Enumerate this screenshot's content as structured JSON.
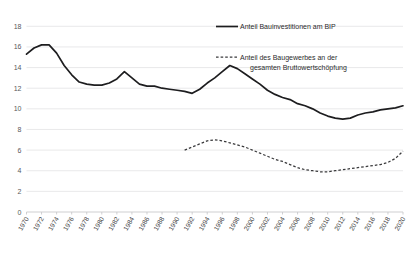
{
  "chart_data": {
    "type": "line",
    "title": "",
    "subtitle": "",
    "xlabel": "",
    "ylabel": "",
    "ylim": [
      0,
      19
    ],
    "xlim": [
      1970,
      2020
    ],
    "grid": true,
    "legend_position": "top-right",
    "y_ticks": [
      "0",
      "2",
      "4",
      "6",
      "8",
      "10",
      "12",
      "14",
      "16",
      "18"
    ],
    "y_tick_values": [
      0,
      2,
      4,
      6,
      8,
      10,
      12,
      14,
      16,
      18
    ],
    "x_ticks": [
      "1970",
      "1972",
      "1974",
      "1976",
      "1978",
      "1980",
      "1982",
      "1984",
      "1986",
      "1988",
      "1990",
      "1992",
      "1994",
      "1996",
      "1998",
      "2000",
      "2002",
      "2004",
      "2006",
      "2008",
      "2010",
      "2012",
      "2014",
      "2016",
      "2018",
      "2020"
    ],
    "x_tick_values": [
      1970,
      1972,
      1974,
      1976,
      1978,
      1980,
      1982,
      1984,
      1986,
      1988,
      1990,
      1992,
      1994,
      1996,
      1998,
      2000,
      2002,
      2004,
      2006,
      2008,
      2010,
      2012,
      2014,
      2016,
      2018,
      2020
    ],
    "series": [
      {
        "name": "Anteil Bauinvestitionen am BIP",
        "style": "solid",
        "color": "#1d1d1f",
        "x": [
          1970,
          1971,
          1972,
          1973,
          1974,
          1975,
          1976,
          1977,
          1978,
          1979,
          1980,
          1981,
          1982,
          1983,
          1984,
          1985,
          1986,
          1987,
          1988,
          1989,
          1990,
          1991,
          1992,
          1993,
          1994,
          1995,
          1996,
          1997,
          1998,
          1999,
          2000,
          2001,
          2002,
          2003,
          2004,
          2005,
          2006,
          2007,
          2008,
          2009,
          2010,
          2011,
          2012,
          2013,
          2014,
          2015,
          2016,
          2017,
          2018,
          2019,
          2020
        ],
        "values": [
          15.3,
          15.9,
          16.2,
          16.2,
          15.4,
          14.2,
          13.3,
          12.6,
          12.4,
          12.3,
          12.3,
          12.5,
          12.9,
          13.6,
          13.0,
          12.4,
          12.2,
          12.2,
          12.0,
          11.9,
          11.8,
          11.7,
          11.5,
          11.9,
          12.5,
          13.0,
          13.6,
          14.2,
          13.9,
          13.4,
          12.9,
          12.4,
          11.8,
          11.4,
          11.1,
          10.9,
          10.5,
          10.3,
          10.0,
          9.6,
          9.3,
          9.1,
          9.0,
          9.1,
          9.4,
          9.6,
          9.7,
          9.9,
          10.0,
          10.1,
          10.3
        ]
      },
      {
        "name": "Anteil des Baugewerbes an der gesamten Bruttowertschöpfung",
        "style": "dashed",
        "color": "#3a3a3c",
        "x": [
          1991,
          1992,
          1993,
          1994,
          1995,
          1996,
          1997,
          1998,
          1999,
          2000,
          2001,
          2002,
          2003,
          2004,
          2005,
          2006,
          2007,
          2008,
          2009,
          2010,
          2011,
          2012,
          2013,
          2014,
          2015,
          2016,
          2017,
          2018,
          2019,
          2020
        ],
        "values": [
          6.0,
          6.3,
          6.6,
          6.9,
          7.0,
          6.9,
          6.7,
          6.5,
          6.3,
          6.0,
          5.7,
          5.4,
          5.1,
          4.9,
          4.6,
          4.3,
          4.1,
          4.0,
          3.9,
          3.9,
          4.0,
          4.1,
          4.2,
          4.3,
          4.4,
          4.5,
          4.6,
          4.8,
          5.2,
          5.9
        ]
      }
    ],
    "legend": [
      {
        "label": "Anteil Bauinvestitionen am BIP",
        "style": "solid"
      },
      {
        "label_line1": "Anteil des Baugewerbes an der",
        "label_line2": "gesamten Bruttowertschöpfung",
        "style": "dashed"
      }
    ]
  }
}
